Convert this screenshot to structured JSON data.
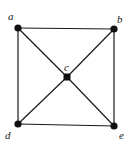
{
  "diagram": {
    "type": "graph",
    "vertices": [
      {
        "id": "a",
        "label": "a",
        "x": 18,
        "y": 28,
        "lx": 8,
        "ly": 20
      },
      {
        "id": "b",
        "label": "b",
        "x": 114,
        "y": 29,
        "lx": 117,
        "ly": 23
      },
      {
        "id": "c",
        "label": "c",
        "x": 67,
        "y": 77,
        "lx": 64,
        "ly": 71
      },
      {
        "id": "d",
        "label": "d",
        "x": 18,
        "y": 124,
        "lx": 5,
        "ly": 139
      },
      {
        "id": "e",
        "label": "e",
        "x": 114,
        "y": 126,
        "lx": 119,
        "ly": 139
      }
    ],
    "edges": [
      [
        "a",
        "b"
      ],
      [
        "b",
        "e"
      ],
      [
        "e",
        "d"
      ],
      [
        "d",
        "a"
      ],
      [
        "a",
        "c"
      ],
      [
        "c",
        "e"
      ],
      [
        "b",
        "c"
      ],
      [
        "c",
        "d"
      ]
    ],
    "colors": {
      "edge": "#1a1a1a",
      "vertex": "#111111",
      "label": "#222222"
    }
  }
}
